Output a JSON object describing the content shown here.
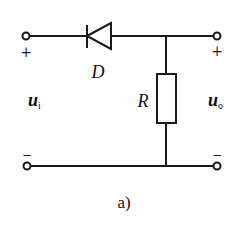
{
  "diagram": {
    "caption": "a)",
    "components": {
      "diode": {
        "label": "D"
      },
      "resistor": {
        "label": "R"
      }
    },
    "input": {
      "symbol": "u",
      "subscript": "i",
      "plus": "+",
      "minus": "−"
    },
    "output": {
      "symbol": "u",
      "subscript": "o",
      "plus": "+",
      "minus": "−"
    },
    "colors": {
      "line": "#1a1a1a",
      "background": "#ffffff"
    }
  }
}
